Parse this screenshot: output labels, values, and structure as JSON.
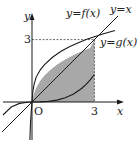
{
  "diagram": {
    "labels": {
      "f_curve": "y=f(x)",
      "identity_line": "y=x",
      "g_curve": "y=g(x)",
      "x_axis": "x",
      "y_axis": "y",
      "origin": "O",
      "x_tick": "3",
      "y_tick": "3"
    },
    "intersection_point": [
      3,
      3
    ],
    "shaded_region": "area under y=g(x) from x=0 to x=3",
    "colors": {
      "shade": "#a8a8a8",
      "curve": "#1a1a1a",
      "dashed": "#444444"
    }
  }
}
